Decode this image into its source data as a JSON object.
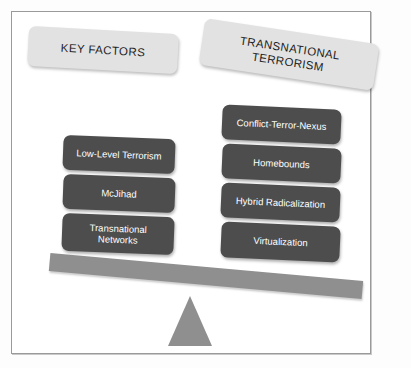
{
  "diagram": {
    "title_left": "KEY FACTORS",
    "title_right_line1": "TRANSNATIONAL",
    "title_right_line2": "TERRORISM",
    "colors": {
      "header_box": "#e2e2e2",
      "factor_box": "#4d4d4d",
      "factor_text": "#ffffff",
      "beam": "#8f8f8f",
      "fulcrum": "#8f8f8f",
      "frame_border": "#9a9a9a",
      "background": "#ffffff"
    },
    "left_column": {
      "heading": "KEY FACTORS",
      "items": [
        {
          "label": "Low-Level Terrorism"
        },
        {
          "label": "McJihad"
        },
        {
          "label": "Transnational Networks",
          "line1": "Transnational",
          "line2": "Networks"
        }
      ]
    },
    "right_column": {
      "heading": "TRANSNATIONAL TERRORISM",
      "items": [
        {
          "label": "Conflict-Terror-Nexus"
        },
        {
          "label": "Homebounds"
        },
        {
          "label": "Hybrid Radicalization"
        },
        {
          "label": "Virtualization"
        }
      ]
    },
    "balance": {
      "beam_name": "balance-beam",
      "fulcrum_name": "fulcrum-triangle",
      "tilt_direction": "right-side-down"
    }
  }
}
